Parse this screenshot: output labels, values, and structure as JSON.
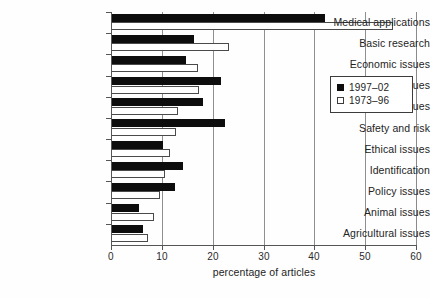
{
  "chart_data": {
    "type": "bar",
    "orientation": "horizontal",
    "title": "",
    "xlabel": "percentage of articles",
    "ylabel": "",
    "xlim": [
      0,
      60
    ],
    "xticks": [
      0,
      10,
      20,
      30,
      40,
      50,
      60
    ],
    "xtick_labels": [
      "0",
      "10",
      "20",
      "30",
      "40",
      "50",
      "60"
    ],
    "grid": "vertical",
    "legend_position": "center-right",
    "categories": [
      "Medical applications",
      "Basic research",
      "Economic issues",
      "Regulatory issues",
      "Other issues",
      "Safety and risk",
      "Ethical issues",
      "Identification",
      "Policy issues",
      "Animal issues",
      "Agricultural issues"
    ],
    "series": [
      {
        "name": "1997–02",
        "color": "#0d0d0d",
        "values": [
          42.0,
          16.3,
          14.8,
          21.6,
          18.1,
          22.4,
          10.2,
          14.2,
          12.6,
          5.5,
          6.2
        ]
      },
      {
        "name": "1973–96",
        "color": "#ffffff",
        "values": [
          55.5,
          23.2,
          17.1,
          17.3,
          13.2,
          12.8,
          11.6,
          10.6,
          9.6,
          8.5,
          7.3
        ]
      }
    ]
  },
  "legend": {
    "items": [
      {
        "label": "1997–02",
        "swatch": "filled-square"
      },
      {
        "label": "1973–96",
        "swatch": "open-square"
      }
    ]
  },
  "axis": {
    "x_title": "percentage of articles"
  }
}
